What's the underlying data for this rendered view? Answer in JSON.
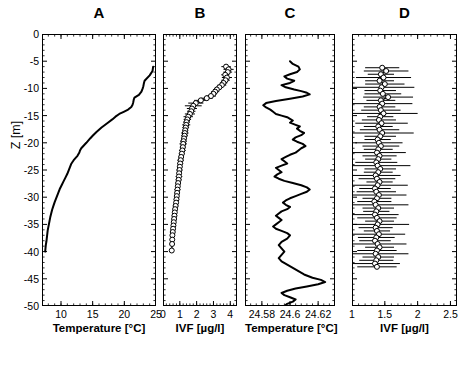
{
  "figure": {
    "width": 463,
    "height": 373,
    "background": "#ffffff",
    "line_color": "#000000",
    "marker_face": "#ffffff",
    "marker_edge": "#000000"
  },
  "yaxis": {
    "label": "Z [m]",
    "ticks": [
      "0",
      "-5",
      "-10",
      "-15",
      "-20",
      "-25",
      "-30",
      "-35",
      "-40",
      "-45",
      "-50"
    ],
    "tick_values": [
      0,
      -5,
      -10,
      -15,
      -20,
      -25,
      -30,
      -35,
      -40,
      -45,
      -50
    ],
    "range": [
      -50,
      0
    ]
  },
  "chart_data": [
    {
      "id": "A",
      "type": "line",
      "title": "A",
      "xlabel": "Temperature [°C]",
      "ylabel": "Z [m]",
      "xlim": [
        7,
        25
      ],
      "ylim": [
        -50,
        0
      ],
      "xticks": [
        10,
        15,
        20,
        25
      ],
      "xticklabels": [
        "10",
        "15",
        "20",
        "25"
      ],
      "grid": false,
      "legend": "none",
      "markers": false,
      "errorbars": false,
      "x": [
        24.55,
        24.5,
        24.45,
        24.0,
        23.2,
        23.1,
        23.05,
        23.0,
        22.9,
        22.7,
        22.3,
        21.6,
        21.5,
        21.45,
        21.4,
        21.3,
        21.1,
        20.6,
        19.9,
        19.2,
        18.6,
        18.1,
        17.3,
        16.4,
        15.6,
        15.0,
        14.6,
        14.3,
        14.0,
        13.6,
        13.2,
        13.0,
        12.9,
        12.6,
        12.0,
        11.6,
        11.4,
        11.2,
        11.0,
        10.7,
        10.4,
        10.1,
        9.8,
        9.6,
        9.4,
        9.2,
        9.0,
        8.8,
        8.6,
        8.45,
        8.3,
        8.2,
        8.1,
        8.0,
        7.9,
        7.85,
        7.8,
        7.75,
        7.7,
        7.6,
        7.55,
        7.5
      ],
      "y": [
        -6.0,
        -6.4,
        -6.8,
        -7.6,
        -8.6,
        -9.0,
        -9.3,
        -9.6,
        -10.0,
        -10.6,
        -11.2,
        -11.7,
        -12.0,
        -12.3,
        -12.6,
        -13.0,
        -13.4,
        -13.9,
        -14.3,
        -14.7,
        -15.2,
        -15.7,
        -16.4,
        -17.2,
        -18.0,
        -18.7,
        -19.2,
        -19.6,
        -20.0,
        -20.5,
        -21.0,
        -21.4,
        -21.8,
        -22.4,
        -23.2,
        -23.9,
        -24.5,
        -25.1,
        -25.7,
        -26.4,
        -27.1,
        -27.8,
        -28.5,
        -29.1,
        -29.7,
        -30.3,
        -30.9,
        -31.6,
        -32.3,
        -33.0,
        -33.7,
        -34.3,
        -34.9,
        -35.5,
        -36.1,
        -36.6,
        -37.1,
        -37.6,
        -38.1,
        -38.8,
        -39.4,
        -40.0
      ]
    },
    {
      "id": "B",
      "type": "line",
      "title": "B",
      "xlabel": "IVF [µg/l]",
      "ylabel": "Z [m]",
      "xlim": [
        0,
        4.4
      ],
      "ylim": [
        -50,
        0
      ],
      "xticks": [
        0,
        1,
        2,
        3,
        4
      ],
      "xticklabels": [
        "0",
        "1",
        "2",
        "3",
        "4"
      ],
      "grid": false,
      "legend": "none",
      "markers": true,
      "marker_style": "white-filled-circle",
      "errorbars": true,
      "errorbar_orientation": "horizontal",
      "x": [
        3.75,
        3.9,
        3.85,
        3.7,
        3.8,
        3.72,
        3.6,
        3.5,
        3.35,
        3.2,
        3.1,
        3.0,
        2.85,
        2.6,
        2.25,
        1.95,
        1.8,
        1.72,
        1.68,
        1.6,
        1.5,
        1.45,
        1.4,
        1.38,
        1.35,
        1.32,
        1.3,
        1.28,
        1.25,
        1.22,
        1.2,
        1.18,
        1.15,
        1.12,
        1.08,
        1.05,
        1.02,
        1.0,
        0.98,
        0.96,
        0.95,
        0.93,
        0.9,
        0.88,
        0.86,
        0.84,
        0.82,
        0.8,
        0.78,
        0.75,
        0.72,
        0.7,
        0.68,
        0.66,
        0.64,
        0.62,
        0.6,
        0.58,
        0.56,
        0.55,
        0.54,
        0.52
      ],
      "xerr": [
        0.28,
        0.3,
        0.26,
        0.24,
        0.3,
        0.25,
        0.22,
        0.26,
        0.2,
        0.22,
        0.24,
        0.2,
        0.3,
        0.35,
        0.4,
        0.45,
        0.5,
        0.3,
        0.25,
        0.3,
        0.28,
        0.22,
        0.2,
        0.24,
        0.2,
        0.18,
        0.22,
        0.2,
        0.18,
        0.2,
        0.22,
        0.18,
        0.2,
        0.18,
        0.16,
        0.2,
        0.18,
        0.16,
        0.18,
        0.16,
        0.2,
        0.18,
        0.16,
        0.14,
        0.18,
        0.16,
        0.14,
        0.16,
        0.14,
        0.16,
        0.14,
        0.12,
        0.16,
        0.14,
        0.12,
        0.14,
        0.12,
        0.14,
        0.12,
        0.14,
        0.12,
        0.14
      ],
      "y": [
        -6.0,
        -6.5,
        -7.0,
        -7.5,
        -8.0,
        -8.5,
        -9.0,
        -9.4,
        -9.8,
        -10.2,
        -10.6,
        -11.0,
        -11.4,
        -11.8,
        -12.2,
        -12.7,
        -13.2,
        -13.7,
        -14.2,
        -14.7,
        -15.2,
        -15.7,
        -16.2,
        -16.7,
        -17.2,
        -17.7,
        -18.2,
        -18.7,
        -19.2,
        -19.7,
        -20.2,
        -20.8,
        -21.4,
        -22.0,
        -22.6,
        -23.2,
        -23.8,
        -24.4,
        -25.0,
        -25.6,
        -26.2,
        -26.8,
        -27.4,
        -28.0,
        -28.6,
        -29.2,
        -29.8,
        -30.4,
        -31.0,
        -31.6,
        -32.2,
        -32.8,
        -33.4,
        -34.0,
        -34.6,
        -35.2,
        -35.8,
        -36.4,
        -37.0,
        -37.8,
        -38.6,
        -39.8
      ]
    },
    {
      "id": "C",
      "type": "line",
      "title": "C",
      "xlabel": "Temperature [°C]",
      "ylabel": "Z [m]",
      "xlim": [
        24.568,
        24.632
      ],
      "ylim": [
        -50,
        0
      ],
      "xticks": [
        24.58,
        24.6,
        24.62
      ],
      "xticklabels": [
        "24.58",
        "24.6",
        "24.62"
      ],
      "grid": false,
      "legend": "none",
      "markers": false,
      "errorbars": false,
      "x": [
        24.6,
        24.602,
        24.606,
        24.607,
        24.605,
        24.6,
        24.596,
        24.598,
        24.603,
        24.6,
        24.594,
        24.597,
        24.603,
        24.608,
        24.612,
        24.614,
        24.609,
        24.6,
        24.59,
        24.583,
        24.581,
        24.583,
        24.586,
        24.588,
        24.59,
        24.594,
        24.598,
        24.6,
        24.602,
        24.6,
        24.604,
        24.607,
        24.605,
        24.607,
        24.61,
        24.608,
        24.604,
        24.602,
        24.605,
        24.609,
        24.611,
        24.608,
        24.606,
        24.604,
        24.6,
        24.597,
        24.594,
        24.596,
        24.598,
        24.594,
        24.59,
        24.592,
        24.594,
        24.591,
        24.589,
        24.592,
        24.596,
        24.602,
        24.608,
        24.612,
        24.614,
        24.612,
        24.608,
        24.604,
        24.6,
        24.597,
        24.595,
        24.597,
        24.6,
        24.598,
        24.594,
        24.592,
        24.59,
        24.592,
        24.594,
        24.592,
        24.59,
        24.588,
        24.59,
        24.594,
        24.598,
        24.6,
        24.598,
        24.594,
        24.592,
        24.594,
        24.596,
        24.594,
        24.592,
        24.594,
        24.598,
        24.602,
        24.606,
        24.61,
        24.616,
        24.622,
        24.625,
        24.62,
        24.612,
        24.604,
        24.598,
        24.594,
        24.596,
        24.6,
        24.604,
        24.602,
        24.598,
        24.596
      ],
      "y": [
        -5.0,
        -5.5,
        -6.0,
        -6.5,
        -7.0,
        -7.4,
        -7.8,
        -8.2,
        -8.6,
        -9.0,
        -9.4,
        -9.8,
        -10.2,
        -10.5,
        -10.8,
        -11.1,
        -11.5,
        -11.9,
        -12.3,
        -12.7,
        -13.1,
        -13.5,
        -13.9,
        -14.3,
        -14.7,
        -15.0,
        -15.3,
        -15.6,
        -15.9,
        -16.3,
        -16.7,
        -17.0,
        -17.4,
        -17.8,
        -18.2,
        -18.6,
        -19.0,
        -19.4,
        -19.8,
        -20.2,
        -20.6,
        -21.0,
        -21.4,
        -21.8,
        -22.2,
        -22.6,
        -23.0,
        -23.4,
        -23.8,
        -24.2,
        -24.6,
        -25.0,
        -25.4,
        -25.8,
        -26.2,
        -26.6,
        -27.0,
        -27.4,
        -27.8,
        -28.2,
        -28.6,
        -29.0,
        -29.4,
        -29.8,
        -30.2,
        -30.6,
        -31.0,
        -31.4,
        -31.8,
        -32.2,
        -32.6,
        -33.0,
        -33.4,
        -33.8,
        -34.2,
        -34.6,
        -35.0,
        -35.4,
        -35.8,
        -36.2,
        -36.6,
        -37.0,
        -37.6,
        -38.2,
        -38.8,
        -39.4,
        -40.0,
        -40.6,
        -41.2,
        -41.8,
        -42.4,
        -43.0,
        -43.6,
        -44.2,
        -44.8,
        -45.2,
        -45.6,
        -46.0,
        -46.4,
        -46.8,
        -47.2,
        -47.6,
        -48.0,
        -48.4,
        -48.8,
        -49.2,
        -49.6,
        -50.0
      ]
    },
    {
      "id": "D",
      "type": "line",
      "title": "D",
      "xlabel": "IVF [µg/l]",
      "ylabel": "Z [m]",
      "xlim": [
        1.0,
        2.6
      ],
      "ylim": [
        -50,
        0
      ],
      "xticks": [
        1,
        1.5,
        2,
        2.5
      ],
      "xticklabels": [
        "1",
        "1.5",
        "2",
        "2.5"
      ],
      "grid": false,
      "legend": "none",
      "markers": true,
      "marker_style": "white-filled-circle",
      "errorbars": true,
      "errorbar_orientation": "horizontal",
      "x": [
        1.46,
        1.52,
        1.44,
        1.48,
        1.42,
        1.5,
        1.45,
        1.43,
        1.47,
        1.55,
        1.44,
        1.46,
        1.42,
        1.44,
        1.48,
        1.43,
        1.41,
        1.45,
        1.4,
        1.42,
        1.46,
        1.43,
        1.39,
        1.41,
        1.44,
        1.4,
        1.38,
        1.42,
        1.4,
        1.37,
        1.39,
        1.43,
        1.4,
        1.36,
        1.38,
        1.42,
        1.39,
        1.35,
        1.37,
        1.41,
        1.38,
        1.34,
        1.36,
        1.4,
        1.37,
        1.35,
        1.38,
        1.42,
        1.39,
        1.36,
        1.38,
        1.41,
        1.37,
        1.35,
        1.39,
        1.42,
        1.38,
        1.36,
        1.4,
        1.37,
        1.35,
        1.38
      ],
      "xerr": [
        0.26,
        0.34,
        0.2,
        0.42,
        0.22,
        0.3,
        0.5,
        0.24,
        0.28,
        0.38,
        0.22,
        0.46,
        0.24,
        0.3,
        0.52,
        0.2,
        0.26,
        0.4,
        0.22,
        0.3,
        0.48,
        0.24,
        0.2,
        0.36,
        0.28,
        0.22,
        0.44,
        0.26,
        0.2,
        0.32,
        0.5,
        0.24,
        0.22,
        0.38,
        0.28,
        0.2,
        0.46,
        0.24,
        0.3,
        0.42,
        0.22,
        0.26,
        0.5,
        0.24,
        0.2,
        0.36,
        0.3,
        0.22,
        0.48,
        0.26,
        0.2,
        0.4,
        0.28,
        0.24,
        0.44,
        0.22,
        0.3,
        0.5,
        0.24,
        0.26,
        0.38,
        0.3
      ],
      "y": [
        -6.2,
        -6.8,
        -7.4,
        -8.0,
        -8.6,
        -9.2,
        -9.8,
        -10.4,
        -11.0,
        -11.6,
        -12.2,
        -12.8,
        -13.4,
        -14.0,
        -14.6,
        -15.2,
        -15.8,
        -16.4,
        -17.0,
        -17.6,
        -18.2,
        -18.8,
        -19.4,
        -20.0,
        -20.6,
        -21.2,
        -21.8,
        -22.4,
        -23.0,
        -23.6,
        -24.2,
        -24.8,
        -25.4,
        -26.0,
        -26.6,
        -27.2,
        -27.8,
        -28.4,
        -29.0,
        -29.6,
        -30.2,
        -30.8,
        -31.4,
        -32.0,
        -32.6,
        -33.2,
        -33.8,
        -34.4,
        -35.0,
        -35.6,
        -36.2,
        -36.8,
        -37.4,
        -38.0,
        -38.6,
        -39.2,
        -39.8,
        -40.4,
        -41.0,
        -41.6,
        -42.2,
        -42.8
      ]
    }
  ]
}
